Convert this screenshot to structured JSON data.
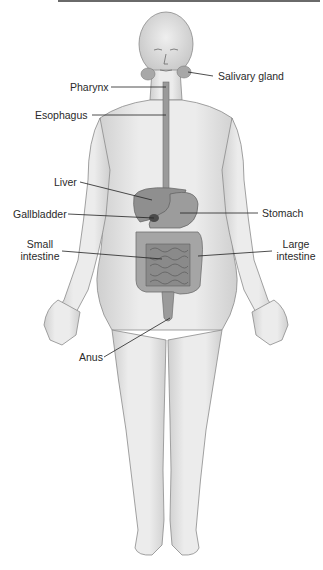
{
  "diagram": {
    "colors": {
      "skin_fill": "#e6e6e6",
      "skin_shadow": "#c8c8c8",
      "outline": "#8a8a8a",
      "organ_fill": "#8f8f8f",
      "organ_dark": "#6e6e6e",
      "leader_line": "#222222",
      "label_text": "#2a2a2a"
    },
    "labels": [
      {
        "id": "salivary-gland",
        "text": "Salivary gland"
      },
      {
        "id": "pharynx",
        "text": "Pharynx"
      },
      {
        "id": "esophagus",
        "text": "Esophagus"
      },
      {
        "id": "liver",
        "text": "Liver"
      },
      {
        "id": "gallbladder",
        "text": "Gallbladder"
      },
      {
        "id": "stomach",
        "text": "Stomach"
      },
      {
        "id": "small-intestine",
        "text": "Small intestine",
        "line1": "Small",
        "line2": "intestine"
      },
      {
        "id": "large-intestine",
        "text": "Large intestine",
        "line1": "Large",
        "line2": "intestine"
      },
      {
        "id": "anus",
        "text": "Anus"
      }
    ]
  }
}
